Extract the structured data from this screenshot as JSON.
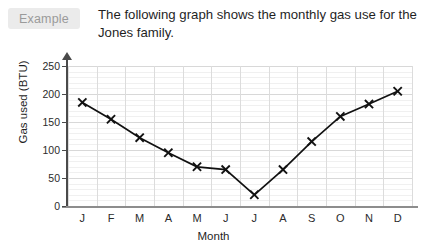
{
  "badge": {
    "label": "Example"
  },
  "prompt": {
    "text": "The following graph shows the monthly gas use for the Jones family."
  },
  "chart_data": {
    "type": "line",
    "title": "",
    "xlabel": "Month",
    "ylabel": "Gas used (BTU)",
    "categories": [
      "J",
      "F",
      "M",
      "A",
      "M",
      "J",
      "J",
      "A",
      "S",
      "O",
      "N",
      "D"
    ],
    "category_names": [
      "January",
      "February",
      "March",
      "April",
      "May",
      "June",
      "July",
      "August",
      "September",
      "October",
      "November",
      "December"
    ],
    "values": [
      185,
      155,
      122,
      95,
      70,
      65,
      20,
      65,
      115,
      160,
      182,
      205
    ],
    "series": [
      {
        "name": "Gas used (BTU)",
        "values": [
          185,
          155,
          122,
          95,
          70,
          65,
          20,
          65,
          115,
          160,
          182,
          205
        ]
      }
    ],
    "ylim": [
      0,
      250
    ],
    "ytick_values": [
      0,
      50,
      100,
      150,
      200,
      250
    ],
    "ytick_labels": [
      "0",
      "50",
      "100",
      "150",
      "200",
      "250"
    ],
    "yminor_step": 10,
    "grid": true,
    "legend": false,
    "marker": "x",
    "line_color": "#111111",
    "grid_color": "#dcdcdc",
    "minor_grid_color": "#f0f0f0"
  },
  "colors": {
    "badge_bg": "#ebebeb",
    "badge_text": "#9a9a9a",
    "text": "#1f1f1f",
    "axis": "#4a4a4a"
  }
}
